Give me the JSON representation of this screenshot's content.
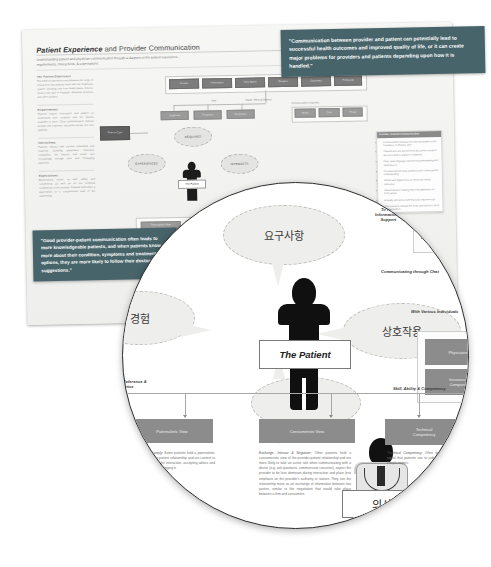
{
  "poster": {
    "title_strong": "Patient Experience",
    "title_rest": " and Provider Communication",
    "subtitle": "Understanding patient and physician communication through a diagram of the patient experience, requirements, interactions, & expectations",
    "left_column": [
      {
        "heading": "The Patient Experience",
        "body": "The patient experience encompasses the range of interactions that patients have with the healthcare system, including care from health plans, doctors, nurses and staff in hospitals, physician practices and other facilities."
      },
      {
        "heading": "Requirements",
        "body": "Patients require information and support to understand their condition and the options available to them. Clear communication reduces anxiety and improves outcomes across the care pathway."
      },
      {
        "heading": "Interactions",
        "body": "Patients interact with various individuals and channels including physicians, insurance companies, the internet and email, and increasingly through chat and messaging platforms."
      },
      {
        "heading": "Expectations",
        "body": "Expectations center on skill, ability and competency as well as on the technical competency of the provider. Patients hold either a paternalistic or a consumeristic view of the relationship."
      }
    ],
    "top_row_nodes": [
      "Access",
      "Information",
      "Time Spent",
      "Respect",
      "Outcomes",
      "Follow Up"
    ],
    "mid_row_nodes": [
      "Diagnosis",
      "Treatment",
      "Prevention"
    ],
    "right_row_nodes": [
      "Email",
      "Chat",
      "Portal"
    ],
    "bubbles": [
      "REQUIRES",
      "EXPERIENCES",
      "INTERACTS"
    ],
    "patient_label": "The Patient",
    "captions": {
      "needs": "Needs, Wants & Desires",
      "why": "Why",
      "point_of_care": "Point of Care",
      "channels": "Communication Channels"
    },
    "bullet_panel": {
      "header": "Provider / Patient Communication",
      "items": [
        "Communication between provider and patient is the foundation of effective care.",
        "Patients who are well informed about their condition are more likely to adhere to treatment.",
        "Clear, plain language reduces misunderstanding and medical error.",
        "Providers should invite questions and confirm patient understanding.",
        "Written and digital follow up reinforces verbal instruction.",
        "Shared decision making improves satisfaction for both parties.",
        "Empathy and active listening build long term trust.",
        "Time pressure remains the most cited barrier to good communication."
      ]
    },
    "quote_top": "\"Communication between provider and patient can potentially lead to successful health outcomes and improved quality of life, or it can create major problems for providers and patients depending upon how it is handled.\"",
    "quote_left": "\"Good provider-patient communication often leads to more knowledgeable patients, and when patients know more about their condition, symptoms and treatment options, they are more likely to follow their doctors suggestions.\""
  },
  "lens": {
    "bubbles": {
      "requirements_ko": "요구사항",
      "experience_ko": "경험",
      "interaction_ko": "상호작용",
      "expectation_ko": "기대"
    },
    "patient_label": "The Patient",
    "doctor_label_ko": "의사",
    "captions": {
      "to_find": "To Find\nInformation &\nSupport",
      "internet_email": "The Internet &\nEmail",
      "through_chat": "Communicating through Chat",
      "various_individuals": "With Various Individuals",
      "skill_ability": "Skill, Ability & Competency",
      "reference_expertise": "For Reference &\nExpertise"
    },
    "nodes": {
      "physicians": "Physicians",
      "insurance": "Insurance\nCompany",
      "technical_competency": "Technical\nCompetency",
      "consumerists_view": "Consumerists View",
      "paternalistic_view": "Paternalistic View"
    },
    "body_paternalistic": {
      "lead": "Defer, Trust & Comply:",
      "text": "Some patients hold a paternalistic view of the provider-patient relationship and are content to let the provider lead the interaction, accepting advice and instruction without challenging it."
    },
    "body_consumerist": {
      "lead": "Exchange, Interact & Negotiate:",
      "text": "Other patients hold a consumeristic view of the provider-patient relationship and are more likely to take an active role when communicating with a doctor (e.g. ask questions, communicate concerns), expect the provider to be less dominant during interaction and place less emphasis on the provider's authority or stature. They see the relationship more as an exchange of information between two parties, similar to the negotiation that would take place between a firm and consumers."
    },
    "body_technical": {
      "lead": "Technical Competency:",
      "text": "Often the most visible signal that patients use to judge quality of care. People expect."
    }
  },
  "footer_mark": "",
  "colors": {
    "teal_quote": "#47646a",
    "node_gray": "#7d7d7d",
    "poster_bg": "#f3f3f1",
    "lens_border": "#2f2f2f"
  }
}
